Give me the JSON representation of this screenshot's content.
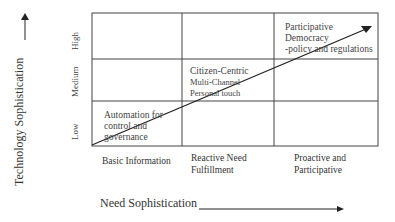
{
  "diagram": {
    "y_axis": {
      "label": "Technology Sophistication",
      "levels": [
        "Low",
        "Medium",
        "High"
      ]
    },
    "x_axis": {
      "label": "Need Sophistication",
      "levels": [
        {
          "line1": "Basic Information",
          "line2": ""
        },
        {
          "line1": "Reactive Need",
          "line2": "Fulfillment"
        },
        {
          "line1": "Proactive and",
          "line2": "Participative"
        }
      ]
    },
    "cells": {
      "low_basic": {
        "line1": "Automation for",
        "line2": "control and",
        "line3": "governance"
      },
      "medium_reactive": {
        "line1": "Citizen-Centric",
        "line2": "Multi-Channel",
        "line3": "Personal touch"
      },
      "high_proactive": {
        "line1": "Participative",
        "line2": "Democracy",
        "line3": "-policy and regulations"
      }
    },
    "colors": {
      "line": "#333333",
      "text": "#333333",
      "background": "#ffffff"
    }
  }
}
